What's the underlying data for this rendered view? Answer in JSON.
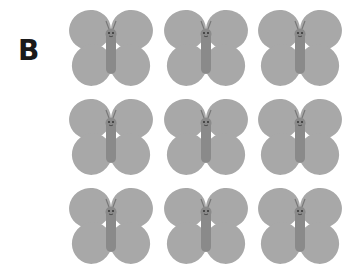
{
  "figure": {
    "panel_label": "B",
    "grid": {
      "rows": 3,
      "cols": 3
    },
    "items": [
      {
        "type": "butterfly-icon",
        "row": 1,
        "col": 1
      },
      {
        "type": "butterfly-icon",
        "row": 1,
        "col": 2
      },
      {
        "type": "butterfly-icon",
        "row": 1,
        "col": 3
      },
      {
        "type": "butterfly-icon",
        "row": 2,
        "col": 1
      },
      {
        "type": "butterfly-icon",
        "row": 2,
        "col": 2
      },
      {
        "type": "butterfly-icon",
        "row": 2,
        "col": 3
      },
      {
        "type": "butterfly-icon",
        "row": 3,
        "col": 1
      },
      {
        "type": "butterfly-icon",
        "row": 3,
        "col": 2
      },
      {
        "type": "butterfly-icon",
        "row": 3,
        "col": 3
      }
    ],
    "colors": {
      "wing": "#a8a8a8",
      "body": "#888888",
      "face": "#333333"
    }
  }
}
